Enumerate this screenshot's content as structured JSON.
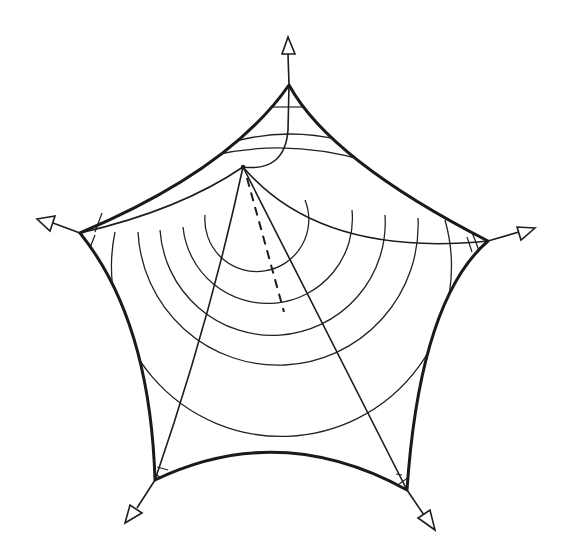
{
  "diagram": {
    "style": "hand-drawn line drawing, black ink on white",
    "colors": {
      "ink": "#1a1a1a",
      "background": "#ffffff"
    },
    "vertices": [
      {
        "id": "top",
        "x": 289,
        "y": 85,
        "arrow_tip": [
          288,
          37
        ]
      },
      {
        "id": "right",
        "x": 488,
        "y": 241,
        "arrow_tip": [
          535,
          228
        ]
      },
      {
        "id": "bottom-right",
        "x": 407,
        "y": 490,
        "arrow_tip": [
          432,
          528
        ]
      },
      {
        "id": "bottom-left",
        "x": 155,
        "y": 480,
        "arrow_tip": [
          128,
          520
        ]
      },
      {
        "id": "left",
        "x": 80,
        "y": 233,
        "arrow_tip": [
          37,
          219
        ]
      }
    ],
    "inner_mast_point": {
      "x": 243,
      "y": 167
    },
    "contour_ring_count": 6,
    "dashed_line": {
      "from": [
        243,
        167
      ],
      "to": [
        284,
        312
      ]
    },
    "text_labels": []
  }
}
